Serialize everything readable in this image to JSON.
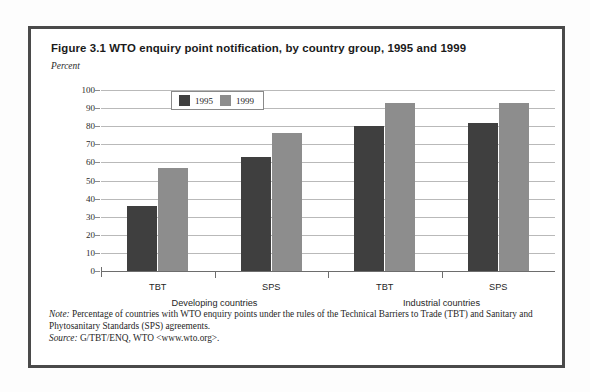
{
  "figure": {
    "title": "Figure 3.1  WTO enquiry point notification, by country group, 1995 and 1999",
    "subtitle": "Percent",
    "note_lead": "Note:",
    "note_text": " Percentage of countries with WTO enquiry points under the rules of the Technical Barriers to Trade (TBT) and Sanitary and Phytosanitary Standards (SPS) agreements.",
    "source_lead": "Source:",
    "source_text": " G/TBT/ENQ, WTO <www.wto.org>."
  },
  "colors": {
    "series_1995": "#3f3f3f",
    "series_1999": "#8d8d8d",
    "frame": "#4a4a4a",
    "gridline": "#b9b9b9"
  },
  "chart_data": {
    "type": "bar",
    "title": "Figure 3.1  WTO enquiry point notification, by country group, 1995 and 1999",
    "subtitle": "Percent",
    "xlabel": "",
    "ylabel": "Percent",
    "ylim": [
      0,
      100
    ],
    "ytick_step": 10,
    "yticks": [
      0,
      10,
      20,
      30,
      40,
      50,
      60,
      70,
      80,
      90,
      100
    ],
    "ytick_labels": [
      "0",
      "10",
      "20",
      "30",
      "40",
      "50",
      "60",
      "70",
      "80",
      "90",
      "100"
    ],
    "grid": true,
    "legend_position": "top-left-inside",
    "categories": [
      "TBT",
      "SPS",
      "TBT",
      "SPS"
    ],
    "groups": [
      {
        "name": "Developing countries",
        "categories": [
          "TBT",
          "SPS"
        ]
      },
      {
        "name": "Industrial countries",
        "categories": [
          "TBT",
          "SPS"
        ]
      }
    ],
    "series": [
      {
        "name": "1995",
        "color": "#3f3f3f",
        "values": [
          36,
          63,
          80,
          82
        ]
      },
      {
        "name": "1999",
        "color": "#8d8d8d",
        "values": [
          57,
          76,
          93,
          93
        ]
      }
    ]
  }
}
